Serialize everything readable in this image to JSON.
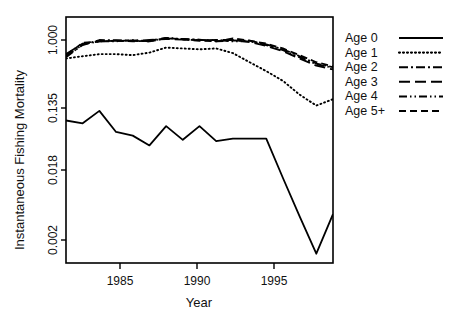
{
  "chart_data": {
    "type": "line",
    "title": "",
    "xlabel": "Year",
    "ylabel": "Instantaneous Fishing Mortality",
    "x_ticks": [
      1985,
      1990,
      1995
    ],
    "x_tick_labels": [
      "1985",
      "1990",
      "1995"
    ],
    "xlim": [
      1982,
      1998
    ],
    "y_scale": "log",
    "y_ticks": [
      1.0,
      0.135,
      0.018,
      0.002
    ],
    "y_tick_labels": [
      "1.000",
      "0.135",
      "0.018",
      "0.002"
    ],
    "ylim": [
      0.0009,
      1.35
    ],
    "grid": false,
    "legend_position": "right",
    "x": [
      1982,
      1983,
      1984,
      1985,
      1986,
      1987,
      1988,
      1989,
      1990,
      1991,
      1992,
      1993,
      1994,
      1995,
      1996,
      1997,
      1998
    ],
    "series": [
      {
        "name": "Age 0",
        "dash": "solid",
        "values": [
          0.09,
          0.082,
          0.123,
          0.062,
          0.055,
          0.04,
          0.075,
          0.048,
          0.075,
          0.046,
          0.05,
          0.05,
          0.05,
          0.014,
          0.0042,
          0.0013,
          0.0045
        ]
      },
      {
        "name": "Age 1",
        "dash": "dotted",
        "values": [
          0.58,
          0.62,
          0.66,
          0.66,
          0.64,
          0.69,
          0.8,
          0.78,
          0.76,
          0.78,
          0.68,
          0.52,
          0.4,
          0.3,
          0.2,
          0.145,
          0.175
        ]
      },
      {
        "name": "Age 2",
        "dash": "dashdot",
        "values": [
          0.62,
          0.86,
          1.0,
          1.06,
          1.04,
          1.02,
          1.12,
          1.1,
          1.08,
          1.02,
          1.05,
          0.98,
          0.88,
          0.76,
          0.62,
          0.5,
          0.45
        ]
      },
      {
        "name": "Age 3",
        "dash": "longdash",
        "values": [
          0.66,
          0.9,
          0.96,
          1.04,
          0.98,
          1.0,
          1.1,
          1.08,
          1.06,
          1.0,
          1.0,
          0.94,
          0.84,
          0.72,
          0.58,
          0.47,
          0.42
        ]
      },
      {
        "name": "Age 4",
        "dash": "dashdotdot",
        "values": [
          0.6,
          0.88,
          1.02,
          1.02,
          1.0,
          1.02,
          1.14,
          1.1,
          1.06,
          1.0,
          1.02,
          0.96,
          0.86,
          0.74,
          0.6,
          0.49,
          0.44
        ]
      },
      {
        "name": "Age 5+",
        "dash": "dashed",
        "values": [
          0.64,
          0.92,
          1.02,
          1.04,
          1.02,
          1.04,
          1.14,
          1.08,
          1.04,
          1.02,
          1.12,
          0.98,
          0.9,
          0.78,
          0.64,
          0.52,
          0.46
        ]
      }
    ]
  },
  "legend": {
    "items": [
      {
        "label": "Age 0"
      },
      {
        "label": "Age 1"
      },
      {
        "label": "Age 2"
      },
      {
        "label": "Age 3"
      },
      {
        "label": "Age 4"
      },
      {
        "label": "Age 5+"
      }
    ]
  }
}
